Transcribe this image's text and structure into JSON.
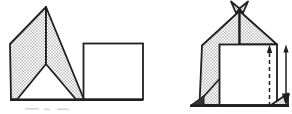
{
  "canvas": {
    "width": "292",
    "height": "114"
  },
  "colors": {
    "page_bg": "#ffffff",
    "ink": "#1f1f1f",
    "shade_dot": "#9e9e9e",
    "shade_bg": "#fcfcfc",
    "dark_fill": "#333333",
    "caption_remnant": "#b9b9b9"
  },
  "figures": {
    "left": {
      "name": "unfolded-peak-sheet",
      "parts": [
        "left-shaded-flap",
        "right-shaded-flap",
        "white-square",
        "baseline"
      ]
    },
    "right": {
      "name": "folded-house",
      "parts": [
        "left-shaded-band",
        "right-roof-flap",
        "white-square",
        "bowtie-tip",
        "fold-diagonal",
        "dark-corner-flap",
        "right-corner-flap",
        "dashed-fold-line",
        "up-arrowhead",
        "double-vertical-arrow",
        "baseline"
      ]
    }
  }
}
